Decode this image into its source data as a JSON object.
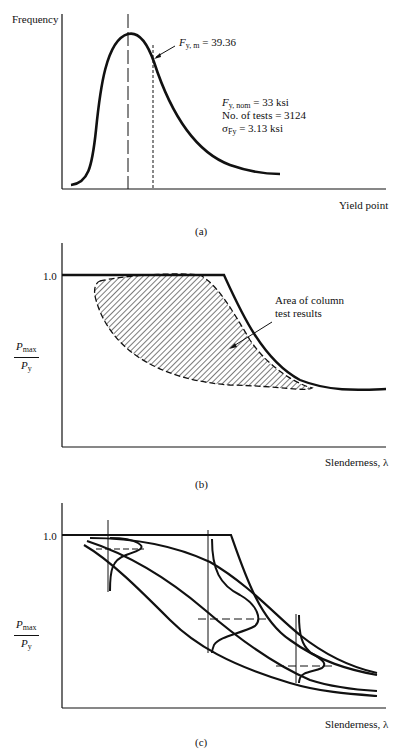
{
  "panel_a": {
    "caption": "(a)",
    "y_label": "Frequency",
    "x_label": "Yield point",
    "mean_label_var": "F",
    "mean_label_sub": "y, m",
    "mean_label_value": "= 39.36",
    "stats": {
      "nom_var": "F",
      "nom_sub": "y, nom",
      "nom_value": "= 33 ksi",
      "tests_line": "No. of tests = 3124",
      "sigma_sym": "σ",
      "sigma_sub": "Fy",
      "sigma_value": "= 3.13 ksi"
    }
  },
  "panel_b": {
    "caption": "(b)",
    "y_tick": "1.0",
    "y_label_num_var": "P",
    "y_label_num_sub": "max",
    "y_label_den_var": "P",
    "y_label_den_sub": "y",
    "x_label": "Slenderness, λ",
    "annotation_line1": "Area of column",
    "annotation_line2": "test results"
  },
  "panel_c": {
    "caption": "(c)",
    "y_tick": "1.0",
    "y_label_num_var": "P",
    "y_label_num_sub": "max",
    "y_label_den_var": "P",
    "y_label_den_sub": "y",
    "x_label": "Slenderness, λ"
  }
}
